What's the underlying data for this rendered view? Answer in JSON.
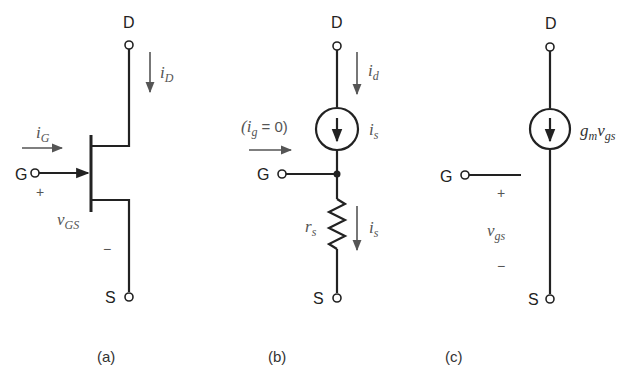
{
  "figure": {
    "panels": [
      {
        "id": "a",
        "caption": "(a)",
        "title": "JFET symbol",
        "terminals": {
          "drain": "D",
          "gate": "G",
          "source": "S"
        },
        "labels": {
          "drain_current_main": "i",
          "drain_current_sub": "D",
          "gate_current_main": "i",
          "gate_current_sub": "G",
          "vgs_main": "v",
          "vgs_sub": "GS",
          "plus": "+",
          "minus": "−"
        }
      },
      {
        "id": "b",
        "caption": "(b)",
        "title": "Small-signal model with source resistance",
        "terminals": {
          "drain": "D",
          "gate": "G",
          "source": "S"
        },
        "labels": {
          "drain_current_main": "i",
          "drain_current_sub": "d",
          "gate_note_open": "(i",
          "gate_note_sub": "g",
          "gate_note_close": " = 0)",
          "source_current_main": "i",
          "source_current_sub": "s",
          "resistor_current_main": "i",
          "resistor_current_sub": "s",
          "resistor_main": "r",
          "resistor_sub": "s"
        }
      },
      {
        "id": "c",
        "caption": "(c)",
        "title": "Transconductance model",
        "terminals": {
          "drain": "D",
          "gate": "G",
          "source": "S"
        },
        "labels": {
          "source_g": "g",
          "source_g_sub": "m",
          "source_v": "v",
          "source_v_sub": "gs",
          "vgs_main": "v",
          "vgs_sub": "gs",
          "plus": "+",
          "minus": "−"
        }
      }
    ]
  }
}
